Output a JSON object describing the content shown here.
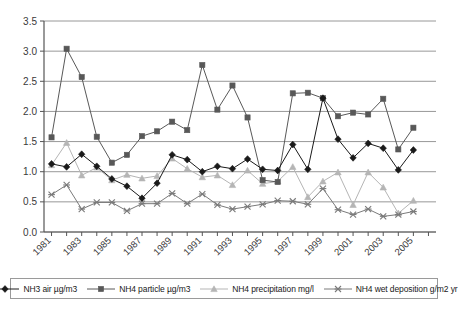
{
  "chart_data": {
    "type": "line",
    "title": "",
    "subtitle": "",
    "xlabel": "",
    "ylabel": "",
    "xlim": [
      1981,
      2006
    ],
    "ylim": [
      0.0,
      3.5
    ],
    "grid": true,
    "legend_position": "bottom",
    "x": [
      1981,
      1982,
      1983,
      1984,
      1985,
      1986,
      1987,
      1988,
      1989,
      1990,
      1991,
      1992,
      1993,
      1994,
      1995,
      1996,
      1997,
      1998,
      1999,
      2000,
      2001,
      2002,
      2003,
      2004,
      2005,
      2006
    ],
    "yticks": [
      "0.0",
      "0.5",
      "1.0",
      "1.5",
      "2.0",
      "2.5",
      "3.0",
      "3.5"
    ],
    "ytick_values": [
      0.0,
      0.5,
      1.0,
      1.5,
      2.0,
      2.5,
      3.0,
      3.5
    ],
    "xtick_labels": [
      "1981",
      "",
      "1983",
      "",
      "1985",
      "",
      "1987",
      "",
      "1989",
      "",
      "1991",
      "",
      "1993",
      "",
      "1995",
      "",
      "1997",
      "",
      "1999",
      "",
      "2001",
      "",
      "2003",
      "",
      "2005",
      ""
    ],
    "xtick_labels_shown": [
      "1981",
      "1983",
      "1985",
      "1987",
      "1989",
      "1991",
      "1993",
      "1995",
      "1997",
      "1999",
      "2001",
      "2003",
      "2005"
    ],
    "series": [
      {
        "name": "NH3 air µg/m3",
        "marker": "diamond",
        "color": "#1a1a1a",
        "values": [
          1.13,
          1.08,
          1.29,
          1.09,
          0.88,
          0.76,
          0.56,
          0.81,
          1.28,
          1.2,
          1.0,
          1.09,
          1.05,
          1.21,
          1.04,
          1.02,
          1.45,
          1.04,
          2.22,
          1.54,
          1.23,
          1.47,
          1.39,
          1.03,
          1.36,
          null
        ]
      },
      {
        "name": "NH4 particle µg/m3",
        "marker": "square",
        "color": "#585858",
        "values": [
          1.57,
          3.04,
          2.57,
          1.58,
          1.15,
          1.28,
          1.59,
          1.67,
          1.83,
          1.69,
          2.77,
          2.03,
          2.43,
          1.9,
          0.86,
          0.83,
          2.3,
          2.31,
          2.22,
          1.92,
          1.98,
          1.95,
          2.21,
          1.37,
          1.73,
          null
        ]
      },
      {
        "name": "NH4 precipitation mg/l",
        "marker": "triangle",
        "color": "#b5b5b5",
        "values": [
          1.11,
          1.48,
          0.94,
          1.07,
          0.86,
          0.95,
          0.89,
          0.93,
          1.22,
          1.05,
          0.91,
          0.94,
          0.78,
          1.02,
          0.8,
          0.84,
          1.08,
          0.58,
          0.84,
          0.99,
          0.45,
          0.99,
          0.74,
          0.31,
          0.52,
          null
        ]
      },
      {
        "name": "NH4 wet deposition g/m2 yr",
        "marker": "cross",
        "color": "#7a7a7a",
        "values": [
          0.62,
          0.78,
          0.38,
          0.49,
          0.49,
          0.35,
          0.47,
          0.47,
          0.64,
          0.47,
          0.63,
          0.45,
          0.38,
          0.42,
          0.46,
          0.52,
          0.51,
          0.46,
          0.72,
          0.37,
          0.29,
          0.38,
          0.26,
          0.29,
          0.34,
          null
        ]
      }
    ]
  },
  "legend": {
    "items": [
      {
        "label": "NH3 air µg/m3",
        "marker": "diamond",
        "color": "#1a1a1a"
      },
      {
        "label": "NH4 particle µg/m3",
        "marker": "square",
        "color": "#585858"
      },
      {
        "label": "NH4 precipitation mg/l",
        "marker": "triangle",
        "color": "#b5b5b5"
      },
      {
        "label": "NH4 wet deposition g/m2 yr",
        "marker": "cross",
        "color": "#7a7a7a"
      }
    ]
  },
  "axes": {
    "grid_color": "#8c8c8c",
    "axis_color": "#555555"
  }
}
